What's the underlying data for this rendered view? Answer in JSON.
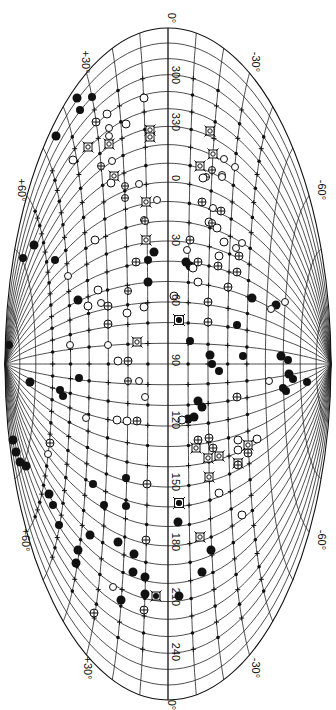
{
  "map": {
    "title": "",
    "projection": "Aitoff (rotated 90°, galactic equator vertical)",
    "center_longitude_label": "90",
    "outline": {
      "cx": 168,
      "cy": 364,
      "rx": 163,
      "ry": 336
    },
    "equator_labels": [
      {
        "text": "300",
        "y": 75
      },
      {
        "text": "330",
        "y": 122
      },
      {
        "text": "0",
        "y": 178
      },
      {
        "text": "30",
        "y": 240
      },
      {
        "text": "60",
        "y": 300
      },
      {
        "text": "90",
        "y": 360
      },
      {
        "text": "120",
        "y": 420
      },
      {
        "text": "150",
        "y": 482
      },
      {
        "text": "180",
        "y": 542
      },
      {
        "text": "210",
        "y": 597
      },
      {
        "text": "240",
        "y": 652
      }
    ],
    "edge_labels": [
      {
        "text": "0°",
        "x": 168,
        "y": 18
      },
      {
        "text": "+30°",
        "x": 82,
        "y": 62
      },
      {
        "text": "-30°",
        "x": 252,
        "y": 62
      },
      {
        "text": "+60°",
        "x": 18,
        "y": 190
      },
      {
        "text": "-60°",
        "x": 318,
        "y": 190
      },
      {
        "text": "+60°",
        "x": 22,
        "y": 540
      },
      {
        "text": "-60°",
        "x": 318,
        "y": 540
      },
      {
        "text": "+30°",
        "x": 84,
        "y": 668
      },
      {
        "text": "-30°",
        "x": 252,
        "y": 668
      },
      {
        "text": "0°",
        "x": 168,
        "y": 705
      }
    ],
    "grid": {
      "latitude_step_deg": 10,
      "longitude_step_deg": 10
    },
    "colors": {
      "ink": "#111111",
      "paper": "#ffffff"
    }
  },
  "legend_symbol_types": [
    "filled-circle",
    "small-dot",
    "open-circle",
    "crossed-circle",
    "boxed-cross",
    "plus"
  ],
  "objects": [
    {
      "t": "filled-circle",
      "x": 77,
      "y": 98,
      "r": 4.5
    },
    {
      "t": "filled-circle",
      "x": 92,
      "y": 97,
      "r": 4
    },
    {
      "t": "filled-circle",
      "x": 80,
      "y": 110,
      "r": 4
    },
    {
      "t": "filled-circle",
      "x": 56,
      "y": 136,
      "r": 4.5
    },
    {
      "t": "open-circle",
      "x": 144,
      "y": 98,
      "r": 4
    },
    {
      "t": "open-circle",
      "x": 107,
      "y": 114,
      "r": 4
    },
    {
      "t": "open-circle",
      "x": 126,
      "y": 124,
      "r": 4
    },
    {
      "t": "crossed-circle",
      "x": 96,
      "y": 122,
      "r": 4
    },
    {
      "t": "open-circle",
      "x": 109,
      "y": 128,
      "r": 3.5
    },
    {
      "t": "open-circle",
      "x": 109,
      "y": 136,
      "r": 3.5
    },
    {
      "t": "boxed-cross",
      "x": 150,
      "y": 130,
      "r": 4
    },
    {
      "t": "boxed-cross",
      "x": 150,
      "y": 137,
      "r": 4
    },
    {
      "t": "boxed-cross",
      "x": 210,
      "y": 131,
      "r": 4
    },
    {
      "t": "boxed-cross",
      "x": 88,
      "y": 147,
      "r": 4
    },
    {
      "t": "boxed-cross",
      "x": 109,
      "y": 144,
      "r": 4
    },
    {
      "t": "open-circle",
      "x": 73,
      "y": 160,
      "r": 4
    },
    {
      "t": "crossed-circle",
      "x": 101,
      "y": 166,
      "r": 3.5
    },
    {
      "t": "open-circle",
      "x": 112,
      "y": 161,
      "r": 3.5
    },
    {
      "t": "boxed-cross",
      "x": 213,
      "y": 154,
      "r": 4
    },
    {
      "t": "open-circle",
      "x": 224,
      "y": 159,
      "r": 3.5
    },
    {
      "t": "boxed-cross",
      "x": 200,
      "y": 166,
      "r": 4
    },
    {
      "t": "crossed-circle",
      "x": 212,
      "y": 170,
      "r": 3.5
    },
    {
      "t": "open-circle",
      "x": 235,
      "y": 167,
      "r": 3.5
    },
    {
      "t": "boxed-cross",
      "x": 114,
      "y": 176,
      "r": 4
    },
    {
      "t": "crossed-circle",
      "x": 206,
      "y": 177,
      "r": 3.5
    },
    {
      "t": "open-circle",
      "x": 222,
      "y": 175,
      "r": 3.5
    },
    {
      "t": "open-circle",
      "x": 111,
      "y": 183,
      "r": 4
    },
    {
      "t": "crossed-circle",
      "x": 125,
      "y": 186,
      "r": 3.5
    },
    {
      "t": "open-circle",
      "x": 139,
      "y": 184,
      "r": 3.5
    },
    {
      "t": "open-circle",
      "x": 203,
      "y": 178,
      "r": 4
    },
    {
      "t": "open-circle",
      "x": 222,
      "y": 177,
      "r": 3.5
    },
    {
      "t": "crossed-circle",
      "x": 125,
      "y": 198,
      "r": 3.5
    },
    {
      "t": "boxed-cross",
      "x": 146,
      "y": 202,
      "r": 4
    },
    {
      "t": "open-circle",
      "x": 157,
      "y": 200,
      "r": 3.5
    },
    {
      "t": "crossed-circle",
      "x": 202,
      "y": 202,
      "r": 4
    },
    {
      "t": "open-circle",
      "x": 213,
      "y": 208,
      "r": 3.5
    },
    {
      "t": "crossed-circle",
      "x": 221,
      "y": 211,
      "r": 4
    },
    {
      "t": "open-circle",
      "x": 144,
      "y": 220,
      "r": 3.5
    },
    {
      "t": "crossed-circle",
      "x": 145,
      "y": 221,
      "r": 3.5
    },
    {
      "t": "open-circle",
      "x": 209,
      "y": 222,
      "r": 4
    },
    {
      "t": "crossed-circle",
      "x": 212,
      "y": 223,
      "r": 3.5
    },
    {
      "t": "open-circle",
      "x": 217,
      "y": 228,
      "r": 4
    },
    {
      "t": "open-circle",
      "x": 95,
      "y": 240,
      "r": 4
    },
    {
      "t": "boxed-cross",
      "x": 146,
      "y": 240,
      "r": 4
    },
    {
      "t": "crossed-circle",
      "x": 190,
      "y": 240,
      "r": 4
    },
    {
      "t": "open-circle",
      "x": 224,
      "y": 242,
      "r": 4
    },
    {
      "t": "open-circle",
      "x": 242,
      "y": 243,
      "r": 3.5
    },
    {
      "t": "open-circle",
      "x": 236,
      "y": 248,
      "r": 3.5
    },
    {
      "t": "filled-circle",
      "x": 154,
      "y": 252,
      "r": 4.5
    },
    {
      "t": "open-circle",
      "x": 187,
      "y": 250,
      "r": 3.5
    },
    {
      "t": "open-circle",
      "x": 219,
      "y": 256,
      "r": 4
    },
    {
      "t": "crossed-circle",
      "x": 239,
      "y": 256,
      "r": 4
    },
    {
      "t": "filled-circle",
      "x": 34,
      "y": 245,
      "r": 4.5
    },
    {
      "t": "filled-circle",
      "x": 23,
      "y": 258,
      "r": 4
    },
    {
      "t": "filled-circle",
      "x": 55,
      "y": 260,
      "r": 4
    },
    {
      "t": "crossed-circle",
      "x": 136,
      "y": 262,
      "r": 4
    },
    {
      "t": "filled-circle",
      "x": 148,
      "y": 260,
      "r": 4
    },
    {
      "t": "filled-circle",
      "x": 186,
      "y": 262,
      "r": 4.5
    },
    {
      "t": "filled-circle",
      "x": 190,
      "y": 266,
      "r": 4.5
    },
    {
      "t": "open-circle",
      "x": 193,
      "y": 268,
      "r": 4
    },
    {
      "t": "crossed-circle",
      "x": 198,
      "y": 262,
      "r": 4
    },
    {
      "t": "crossed-circle",
      "x": 218,
      "y": 266,
      "r": 4
    },
    {
      "t": "open-circle",
      "x": 68,
      "y": 276,
      "r": 3.5
    },
    {
      "t": "crossed-circle",
      "x": 237,
      "y": 272,
      "r": 4
    },
    {
      "t": "filled-circle",
      "x": 148,
      "y": 282,
      "r": 4.5
    },
    {
      "t": "open-circle",
      "x": 98,
      "y": 290,
      "r": 4
    },
    {
      "t": "crossed-circle",
      "x": 128,
      "y": 291,
      "r": 3.5
    },
    {
      "t": "open-circle",
      "x": 198,
      "y": 282,
      "r": 4
    },
    {
      "t": "crossed-circle",
      "x": 228,
      "y": 287,
      "r": 4
    },
    {
      "t": "open-circle",
      "x": 174,
      "y": 296,
      "r": 4
    },
    {
      "t": "filled-circle",
      "x": 78,
      "y": 300,
      "r": 4.5
    },
    {
      "t": "open-circle",
      "x": 88,
      "y": 306,
      "r": 4
    },
    {
      "t": "crossed-circle",
      "x": 108,
      "y": 306,
      "r": 4
    },
    {
      "t": "open-circle",
      "x": 101,
      "y": 303,
      "r": 3.5
    },
    {
      "t": "open-circle",
      "x": 144,
      "y": 307,
      "r": 4
    },
    {
      "t": "open-circle",
      "x": 127,
      "y": 313,
      "r": 4
    },
    {
      "t": "crossed-circle",
      "x": 208,
      "y": 302,
      "r": 4
    },
    {
      "t": "filled-circle",
      "x": 252,
      "y": 298,
      "r": 4.5
    },
    {
      "t": "filled-circle",
      "x": 276,
      "y": 305,
      "r": 4.5
    },
    {
      "t": "open-circle",
      "x": 285,
      "y": 302,
      "r": 3.5
    },
    {
      "t": "open-circle",
      "x": 271,
      "y": 309,
      "r": 3.5
    },
    {
      "t": "boxed-cross",
      "x": 179,
      "y": 320,
      "r": 4.5
    },
    {
      "t": "filled-circle",
      "x": 179,
      "y": 320,
      "r": 3
    },
    {
      "t": "crossed-circle",
      "x": 108,
      "y": 324,
      "r": 4
    },
    {
      "t": "crossed-circle",
      "x": 208,
      "y": 322,
      "r": 4
    },
    {
      "t": "filled-circle",
      "x": 237,
      "y": 325,
      "r": 4
    },
    {
      "t": "boxed-cross",
      "x": 137,
      "y": 342,
      "r": 4
    },
    {
      "t": "filled-circle",
      "x": 190,
      "y": 341,
      "r": 4
    },
    {
      "t": "filled-circle",
      "x": 9,
      "y": 345,
      "r": 4
    },
    {
      "t": "open-circle",
      "x": 70,
      "y": 345,
      "r": 3.5
    },
    {
      "t": "open-circle",
      "x": 108,
      "y": 345,
      "r": 3.5
    },
    {
      "t": "open-circle",
      "x": 118,
      "y": 361,
      "r": 4
    },
    {
      "t": "crossed-circle",
      "x": 128,
      "y": 361,
      "r": 4
    },
    {
      "t": "filled-circle",
      "x": 210,
      "y": 355,
      "r": 4.5
    },
    {
      "t": "filled-circle",
      "x": 212,
      "y": 364,
      "r": 4
    },
    {
      "t": "filled-circle",
      "x": 219,
      "y": 371,
      "r": 4
    },
    {
      "t": "filled-circle",
      "x": 243,
      "y": 356,
      "r": 4
    },
    {
      "t": "filled-circle",
      "x": 281,
      "y": 356,
      "r": 4.5
    },
    {
      "t": "filled-circle",
      "x": 288,
      "y": 360,
      "r": 4
    },
    {
      "t": "filled-circle",
      "x": 289,
      "y": 374,
      "r": 4.5
    },
    {
      "t": "filled-circle",
      "x": 293,
      "y": 379,
      "r": 4
    },
    {
      "t": "filled-circle",
      "x": 30,
      "y": 382,
      "r": 4.5
    },
    {
      "t": "filled-circle",
      "x": 79,
      "y": 378,
      "r": 4
    },
    {
      "t": "crossed-circle",
      "x": 128,
      "y": 381,
      "r": 3.5
    },
    {
      "t": "open-circle",
      "x": 139,
      "y": 381,
      "r": 3.5
    },
    {
      "t": "open-circle",
      "x": 269,
      "y": 381,
      "r": 3.5
    },
    {
      "t": "filled-circle",
      "x": 307,
      "y": 382,
      "r": 4
    },
    {
      "t": "filled-circle",
      "x": 60,
      "y": 390,
      "r": 4
    },
    {
      "t": "filled-circle",
      "x": 63,
      "y": 396,
      "r": 4
    },
    {
      "t": "filled-circle",
      "x": 283,
      "y": 388,
      "r": 4
    },
    {
      "t": "filled-circle",
      "x": 286,
      "y": 391,
      "r": 4
    },
    {
      "t": "open-circle",
      "x": 145,
      "y": 397,
      "r": 3.5
    },
    {
      "t": "crossed-circle",
      "x": 237,
      "y": 397,
      "r": 4
    },
    {
      "t": "filled-circle",
      "x": 198,
      "y": 401,
      "r": 4.5
    },
    {
      "t": "filled-circle",
      "x": 202,
      "y": 407,
      "r": 4.5
    },
    {
      "t": "open-circle",
      "x": 86,
      "y": 418,
      "r": 3.5
    },
    {
      "t": "open-circle",
      "x": 117,
      "y": 420,
      "r": 4
    },
    {
      "t": "open-circle",
      "x": 127,
      "y": 421,
      "r": 4
    },
    {
      "t": "crossed-circle",
      "x": 137,
      "y": 421,
      "r": 4
    },
    {
      "t": "filled-circle",
      "x": 188,
      "y": 419,
      "r": 4.5
    },
    {
      "t": "filled-circle",
      "x": 194,
      "y": 417,
      "r": 4.5
    },
    {
      "t": "open-circle",
      "x": 182,
      "y": 420,
      "r": 4
    },
    {
      "t": "filled-circle",
      "x": 13,
      "y": 440,
      "r": 4.5
    },
    {
      "t": "filled-circle",
      "x": 16,
      "y": 452,
      "r": 4.5
    },
    {
      "t": "crossed-circle",
      "x": 50,
      "y": 443,
      "r": 4
    },
    {
      "t": "open-circle",
      "x": 48,
      "y": 454,
      "r": 3.5
    },
    {
      "t": "crossed-circle",
      "x": 198,
      "y": 440,
      "r": 4
    },
    {
      "t": "crossed-circle",
      "x": 209,
      "y": 438,
      "r": 4
    },
    {
      "t": "open-circle",
      "x": 238,
      "y": 440,
      "r": 4
    },
    {
      "t": "open-circle",
      "x": 257,
      "y": 439,
      "r": 4
    },
    {
      "t": "boxed-cross",
      "x": 196,
      "y": 448,
      "r": 4
    },
    {
      "t": "crossed-circle",
      "x": 213,
      "y": 448,
      "r": 4
    },
    {
      "t": "boxed-cross",
      "x": 219,
      "y": 456,
      "r": 4
    },
    {
      "t": "open-circle",
      "x": 238,
      "y": 450,
      "r": 4
    },
    {
      "t": "boxed-cross",
      "x": 248,
      "y": 445,
      "r": 4
    },
    {
      "t": "crossed-circle",
      "x": 248,
      "y": 453,
      "r": 4
    },
    {
      "t": "boxed-cross",
      "x": 238,
      "y": 463,
      "r": 4
    },
    {
      "t": "boxed-cross",
      "x": 208,
      "y": 458,
      "r": 4
    },
    {
      "t": "crossed-circle",
      "x": 238,
      "y": 465,
      "r": 4
    },
    {
      "t": "filled-circle",
      "x": 20,
      "y": 462,
      "r": 4.5
    },
    {
      "t": "filled-circle",
      "x": 26,
      "y": 466,
      "r": 4.5
    },
    {
      "t": "filled-circle",
      "x": 126,
      "y": 478,
      "r": 4
    },
    {
      "t": "filled-circle",
      "x": 93,
      "y": 484,
      "r": 4
    },
    {
      "t": "crossed-circle",
      "x": 147,
      "y": 484,
      "r": 4
    },
    {
      "t": "boxed-cross",
      "x": 209,
      "y": 477,
      "r": 4
    },
    {
      "t": "filled-circle",
      "x": 49,
      "y": 494,
      "r": 4.5
    },
    {
      "t": "open-circle",
      "x": 219,
      "y": 493,
      "r": 4
    },
    {
      "t": "filled-circle",
      "x": 104,
      "y": 505,
      "r": 4
    },
    {
      "t": "filled-circle",
      "x": 126,
      "y": 506,
      "r": 4
    },
    {
      "t": "boxed-cross",
      "x": 179,
      "y": 503,
      "r": 4.5
    },
    {
      "t": "filled-circle",
      "x": 179,
      "y": 503,
      "r": 3
    },
    {
      "t": "filled-circle",
      "x": 53,
      "y": 505,
      "r": 4
    },
    {
      "t": "open-circle",
      "x": 242,
      "y": 515,
      "r": 4
    },
    {
      "t": "filled-circle",
      "x": 59,
      "y": 525,
      "r": 4
    },
    {
      "t": "filled-circle",
      "x": 90,
      "y": 535,
      "r": 4.5
    },
    {
      "t": "filled-circle",
      "x": 118,
      "y": 542,
      "r": 4.5
    },
    {
      "t": "crossed-circle",
      "x": 146,
      "y": 540,
      "r": 4
    },
    {
      "t": "filled-circle",
      "x": 178,
      "y": 522,
      "r": 4.5
    },
    {
      "t": "boxed-cross",
      "x": 200,
      "y": 537,
      "r": 4
    },
    {
      "t": "filled-circle",
      "x": 78,
      "y": 550,
      "r": 4.5
    },
    {
      "t": "filled-circle",
      "x": 134,
      "y": 554,
      "r": 4.5
    },
    {
      "t": "filled-circle",
      "x": 211,
      "y": 550,
      "r": 4.5
    },
    {
      "t": "filled-circle",
      "x": 76,
      "y": 563,
      "r": 4.5
    },
    {
      "t": "filled-circle",
      "x": 133,
      "y": 572,
      "r": 4.5
    },
    {
      "t": "filled-circle",
      "x": 145,
      "y": 577,
      "r": 4.5
    },
    {
      "t": "filled-circle",
      "x": 202,
      "y": 572,
      "r": 4.5
    },
    {
      "t": "filled-circle",
      "x": 145,
      "y": 594,
      "r": 4.5
    },
    {
      "t": "boxed-cross",
      "x": 156,
      "y": 596,
      "r": 4
    },
    {
      "t": "filled-circle",
      "x": 156,
      "y": 596,
      "r": 3
    },
    {
      "t": "filled-circle",
      "x": 179,
      "y": 596,
      "r": 4.5
    },
    {
      "t": "filled-circle",
      "x": 121,
      "y": 600,
      "r": 4.5
    },
    {
      "t": "crossed-circle",
      "x": 144,
      "y": 610,
      "r": 4
    },
    {
      "t": "crossed-circle",
      "x": 94,
      "y": 613,
      "r": 4
    },
    {
      "t": "open-circle",
      "x": 113,
      "y": 587,
      "r": 3.5
    }
  ]
}
